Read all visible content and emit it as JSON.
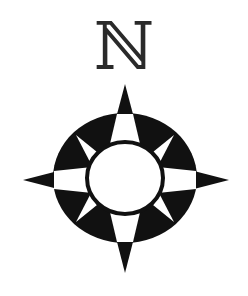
{
  "north_label": "ℕ",
  "colors": {
    "ink": "#111111",
    "paper": "#ffffff",
    "label": "#2a2a2a"
  },
  "compass": {
    "center": [
      125,
      178
    ],
    "points": [
      "N",
      "E",
      "S",
      "W"
    ],
    "secondary_points": [
      "NE",
      "SE",
      "SW",
      "NW"
    ]
  }
}
